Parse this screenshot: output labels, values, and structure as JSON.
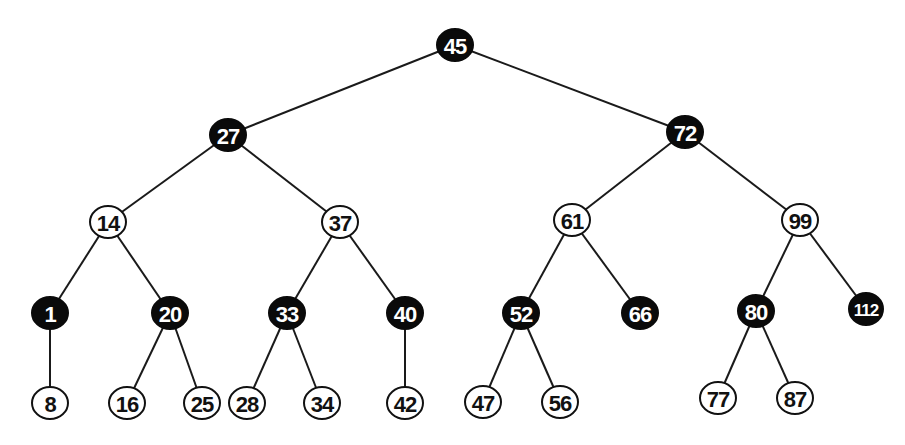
{
  "diagram": {
    "type": "red-black-tree",
    "colors": {
      "black": "#0a0a0a",
      "red_shown_as": "#ffffff",
      "edge": "#1a1a1a"
    },
    "nodes": [
      {
        "id": "n45",
        "label": "45",
        "color": "black",
        "x": 455,
        "y": 45
      },
      {
        "id": "n27",
        "label": "27",
        "color": "black",
        "x": 228,
        "y": 135
      },
      {
        "id": "n72",
        "label": "72",
        "color": "black",
        "x": 685,
        "y": 132
      },
      {
        "id": "n14",
        "label": "14",
        "color": "white",
        "x": 108,
        "y": 222
      },
      {
        "id": "n37",
        "label": "37",
        "color": "white",
        "x": 340,
        "y": 222
      },
      {
        "id": "n61",
        "label": "61",
        "color": "white",
        "x": 572,
        "y": 220
      },
      {
        "id": "n99",
        "label": "99",
        "color": "white",
        "x": 800,
        "y": 220
      },
      {
        "id": "n1",
        "label": "1",
        "color": "black",
        "x": 50,
        "y": 313
      },
      {
        "id": "n20",
        "label": "20",
        "color": "black",
        "x": 170,
        "y": 313
      },
      {
        "id": "n33",
        "label": "33",
        "color": "black",
        "x": 287,
        "y": 313
      },
      {
        "id": "n40",
        "label": "40",
        "color": "black",
        "x": 405,
        "y": 313
      },
      {
        "id": "n52",
        "label": "52",
        "color": "black",
        "x": 521,
        "y": 313
      },
      {
        "id": "n66",
        "label": "66",
        "color": "black",
        "x": 640,
        "y": 313
      },
      {
        "id": "n80",
        "label": "80",
        "color": "black",
        "x": 756,
        "y": 311
      },
      {
        "id": "n112",
        "label": "112",
        "color": "black",
        "x": 866,
        "y": 309
      },
      {
        "id": "n8",
        "label": "8",
        "color": "white",
        "x": 50,
        "y": 403
      },
      {
        "id": "n16",
        "label": "16",
        "color": "white",
        "x": 127,
        "y": 403
      },
      {
        "id": "n25",
        "label": "25",
        "color": "white",
        "x": 202,
        "y": 403
      },
      {
        "id": "n28",
        "label": "28",
        "color": "white",
        "x": 247,
        "y": 403
      },
      {
        "id": "n34",
        "label": "34",
        "color": "white",
        "x": 322,
        "y": 403
      },
      {
        "id": "n42",
        "label": "42",
        "color": "white",
        "x": 405,
        "y": 403
      },
      {
        "id": "n47",
        "label": "47",
        "color": "white",
        "x": 483,
        "y": 402
      },
      {
        "id": "n56",
        "label": "56",
        "color": "white",
        "x": 560,
        "y": 402
      },
      {
        "id": "n77",
        "label": "77",
        "color": "white",
        "x": 718,
        "y": 398
      },
      {
        "id": "n87",
        "label": "87",
        "color": "white",
        "x": 795,
        "y": 398
      }
    ],
    "edges": [
      [
        "n45",
        "n27"
      ],
      [
        "n45",
        "n72"
      ],
      [
        "n27",
        "n14"
      ],
      [
        "n27",
        "n37"
      ],
      [
        "n72",
        "n61"
      ],
      [
        "n72",
        "n99"
      ],
      [
        "n14",
        "n1"
      ],
      [
        "n14",
        "n20"
      ],
      [
        "n37",
        "n33"
      ],
      [
        "n37",
        "n40"
      ],
      [
        "n61",
        "n52"
      ],
      [
        "n61",
        "n66"
      ],
      [
        "n99",
        "n80"
      ],
      [
        "n99",
        "n112"
      ],
      [
        "n1",
        "n8"
      ],
      [
        "n20",
        "n16"
      ],
      [
        "n20",
        "n25"
      ],
      [
        "n33",
        "n28"
      ],
      [
        "n33",
        "n34"
      ],
      [
        "n40",
        "n42"
      ],
      [
        "n52",
        "n47"
      ],
      [
        "n52",
        "n56"
      ],
      [
        "n80",
        "n77"
      ],
      [
        "n80",
        "n87"
      ]
    ]
  }
}
